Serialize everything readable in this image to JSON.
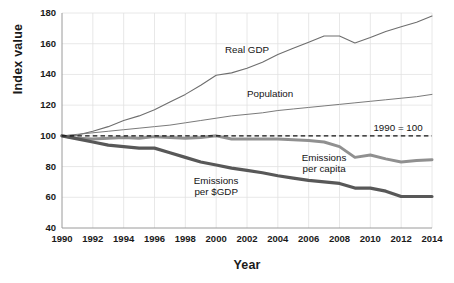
{
  "chart_data": {
    "type": "line",
    "title": "",
    "xlabel": "Year",
    "ylabel": "Index value",
    "xlim": [
      1990,
      2014
    ],
    "ylim": [
      40,
      180
    ],
    "ytick_step": 20,
    "xtick_step": 2,
    "grid": true,
    "legend_position": "inline-annotations",
    "x": [
      1990,
      1991,
      1992,
      1993,
      1994,
      1995,
      1996,
      1997,
      1998,
      1999,
      2000,
      2001,
      2002,
      2003,
      2004,
      2005,
      2006,
      2007,
      2008,
      2009,
      2010,
      2011,
      2012,
      2013,
      2014
    ],
    "yticks": [
      40,
      60,
      80,
      100,
      120,
      140,
      160,
      180
    ],
    "xticks": [
      1990,
      1992,
      1994,
      1996,
      1998,
      2000,
      2002,
      2004,
      2006,
      2008,
      2010,
      2012,
      2014
    ],
    "reference_line": {
      "value": 100,
      "label": "1990 = 100",
      "style": "dashed",
      "color": "#111111"
    },
    "series": [
      {
        "name": "Real GDP",
        "color": "#6e6e6e",
        "width": 1.1,
        "values": [
          100,
          100.5,
          103,
          106,
          110,
          113,
          117,
          122,
          127,
          133,
          139.5,
          141,
          144,
          148,
          153,
          157,
          161,
          165,
          165,
          160.5,
          164,
          168,
          171,
          174,
          178
        ]
      },
      {
        "name": "Population",
        "color": "#7a7a7a",
        "width": 1.0,
        "values": [
          100,
          101,
          102,
          103,
          104,
          105,
          106,
          107,
          108.5,
          110,
          111.5,
          113,
          114,
          115,
          116.5,
          117.5,
          118.5,
          119.5,
          120.5,
          121.5,
          122.5,
          123.5,
          124.5,
          125.5,
          127
        ]
      },
      {
        "name": "Emissions per capita",
        "color": "#909090",
        "width": 3.0,
        "values": [
          100,
          98.5,
          98,
          98.5,
          99,
          98.5,
          99.5,
          99,
          98.5,
          99,
          100,
          98,
          98,
          98,
          98,
          97.5,
          97,
          96,
          93,
          86,
          87.5,
          85,
          83,
          84,
          84.5
        ]
      },
      {
        "name": "Emissions per $GDP",
        "color": "#585858",
        "width": 3.2,
        "values": [
          100,
          98,
          96,
          94,
          93,
          92,
          92,
          89,
          86,
          83,
          81,
          79,
          77.5,
          76,
          74,
          72.5,
          71,
          70,
          69,
          66,
          66,
          64,
          60.5,
          60.5,
          60.5
        ]
      }
    ],
    "annotations": [
      {
        "text_line1": "Real GDP",
        "text_line2": "",
        "marker": "down-arrow",
        "series": "Real GDP",
        "at_year": 2002
      },
      {
        "text_line1": "Population",
        "text_line2": "",
        "marker": "down-arrow",
        "series": "Population",
        "at_year": 2003.5
      },
      {
        "text_line1": "Emissions",
        "text_line2": "per capita",
        "marker": "up-arrow",
        "series": "Emissions per capita",
        "at_year": 2007
      },
      {
        "text_line1": "Emissions",
        "text_line2": "per $GDP",
        "marker": "up-arrow",
        "series": "Emissions per $GDP",
        "at_year": 2000
      }
    ]
  },
  "glyphs": {
    "down_arrow": "▼",
    "up_arrow": "▲"
  }
}
